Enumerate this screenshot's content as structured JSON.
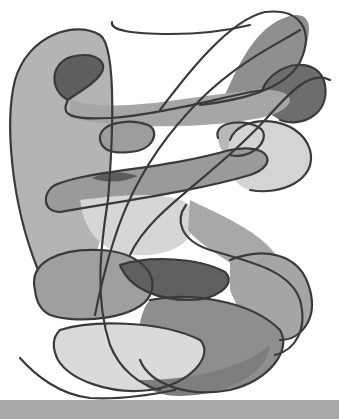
{
  "image": {
    "kind": "abstract-pencil-drawing",
    "palette": {
      "background": "#ffffff",
      "outline": "#3a3a3a",
      "light": "#d9d9d9",
      "mid_light": "#bdbdbd",
      "mid": "#a3a3a3",
      "mid_dark": "#8a8a8a",
      "dark": "#6a6a6a",
      "darkest": "#555555",
      "bottom_band": "#a9a9a9"
    },
    "regions": [
      {
        "name": "left-tall-lobe",
        "fill": "#b4b4b4",
        "d": "M38,270 C10,200 5,120 15,80 C28,35 75,20 100,35 C118,48 112,150 108,200 C100,260 80,300 60,300 Z"
      },
      {
        "name": "top-left-dark-lobe",
        "fill": "#5f5f5f",
        "d": "M68,100 C48,90 50,60 75,56 C95,52 110,62 100,75 C92,86 78,92 68,100 Z"
      },
      {
        "name": "top-right-lobe",
        "fill": "#8f8f8f",
        "d": "M225,95 C240,60 260,20 295,15 C320,14 305,50 300,62 C285,80 265,92 225,95 Z"
      },
      {
        "name": "right-dark-lobe",
        "fill": "#6d6d6d",
        "d": "M262,90 C275,60 320,55 325,85 C330,115 300,128 280,120 C265,113 260,100 262,90 Z"
      },
      {
        "name": "upper-band",
        "fill": "#a6a6a6",
        "d": "M70,100 C120,115 190,95 260,90 C300,88 300,110 260,118 C210,128 130,130 70,118 Z"
      },
      {
        "name": "small-oval-left",
        "fill": "#9d9d9d",
        "d": "M100,140 C98,122 130,118 148,125 C160,130 155,150 130,152 C112,154 102,150 100,140 Z"
      },
      {
        "name": "small-oval-right",
        "fill": "#b8b8b8",
        "d": "M218,138 C212,120 250,118 262,130 C270,142 250,160 230,155 C220,152 219,145 218,138 Z"
      },
      {
        "name": "right-light-oval",
        "fill": "#d4d4d4",
        "d": "M230,140 C240,112 300,115 310,150 C318,180 280,196 250,190 C228,184 224,160 230,140 Z"
      },
      {
        "name": "center-band",
        "fill": "#9a9a9a",
        "d": "M55,185 C90,170 160,170 230,150 C270,142 280,165 250,175 C200,190 130,200 60,212 C42,212 42,192 55,185 Z"
      },
      {
        "name": "center-dark-wedge",
        "fill": "#5c5c5c",
        "d": "M92,178 C108,170 125,172 138,176 C125,182 108,184 92,178 Z"
      },
      {
        "name": "middle-light-field",
        "fill": "#d6d6d6",
        "d": "M80,200 C120,195 170,190 190,205 C200,230 190,250 150,255 C110,258 85,240 80,200 Z"
      },
      {
        "name": "middle-s-curve",
        "fill": "#a8a8a8",
        "d": "M190,200 C220,215 260,230 280,260 C290,280 260,285 240,270 C220,255 200,245 188,230 Z"
      },
      {
        "name": "lower-left-oval",
        "fill": "#9f9f9f",
        "d": "M35,290 C28,262 60,248 100,250 C140,252 160,275 150,295 C140,318 80,325 50,315 C40,310 36,300 35,290 Z"
      },
      {
        "name": "lower-center-dark",
        "fill": "#606060",
        "d": "M120,265 C150,255 200,258 225,272 C238,285 215,300 190,300 C160,300 130,290 120,265 Z"
      },
      {
        "name": "lower-right-lobe",
        "fill": "#a5a5a5",
        "d": "M230,260 C260,248 300,250 310,290 C318,320 300,340 280,340 C255,340 240,315 230,290 Z"
      },
      {
        "name": "lower-gray-shape",
        "fill": "#8e8e8e",
        "d": "M150,300 C190,292 250,300 280,330 C292,350 270,380 230,390 C190,398 150,385 140,360 C135,340 140,310 150,300 Z"
      },
      {
        "name": "bottom-light-oval",
        "fill": "#dadada",
        "d": "M60,330 C90,320 160,320 200,340 C215,355 190,385 150,390 C110,395 70,380 58,360 C52,348 52,338 60,330 Z"
      },
      {
        "name": "bottom-dark-crescent",
        "fill": "#7d7d7d",
        "d": "M140,380 C190,380 240,370 270,345 C268,372 230,395 180,396 C160,396 148,390 140,380 Z"
      }
    ],
    "outlines": [
      {
        "name": "top-squiggle-line",
        "d": "M112,22 C110,30 130,34 170,34 C200,34 230,30 250,25"
      },
      {
        "name": "left-lobe-outline",
        "d": "M108,200 C112,150 118,48 100,35 C75,20 28,35 15,80 C5,120 10,200 38,270"
      },
      {
        "name": "dark-lobe-outline",
        "d": "M68,100 C48,90 50,60 75,56 C95,52 110,62 100,75 C92,86 78,92 68,100 C60,115 70,120 110,118 C160,115 230,95 262,90"
      },
      {
        "name": "top-right-outline",
        "d": "M160,110 C190,70 230,20 265,12 C300,8 315,30 300,62 C285,90 240,100 200,105"
      },
      {
        "name": "right-lobe-outline",
        "d": "M262,90 C275,60 320,55 325,85 C330,115 300,128 280,120"
      },
      {
        "name": "long-diagonal-1",
        "d": "M95,315 C110,240 130,170 200,100 C240,60 285,40 300,30"
      },
      {
        "name": "long-diagonal-2",
        "d": "M130,255 C150,210 210,180 265,120 C290,92 310,70 330,80"
      },
      {
        "name": "center-band-outline",
        "d": "M55,185 C90,170 160,170 230,150 C270,142 280,165 250,175 C200,190 130,200 60,212 C42,212 42,192 55,185 Z"
      },
      {
        "name": "small-oval-left-outline",
        "d": "M100,140 C98,122 130,118 148,125 C160,130 155,150 130,152 C112,154 102,150 100,140 Z"
      },
      {
        "name": "small-oval-right-outline",
        "d": "M218,138 C212,120 250,118 262,130 C270,142 250,160 230,155"
      },
      {
        "name": "right-light-oval-outline",
        "d": "M230,140 C240,112 300,115 310,150 C318,180 280,196 250,190"
      },
      {
        "name": "s-curve-outline",
        "d": "M186,205 C175,220 180,240 210,250 C250,262 290,270 300,300 C308,330 295,350 275,355"
      },
      {
        "name": "lower-left-oval-outline",
        "d": "M35,290 C28,262 60,248 100,250 C140,252 160,275 150,295 C140,318 80,325 50,315 C40,310 36,300 35,290 Z"
      },
      {
        "name": "lower-center-outline",
        "d": "M120,265 C150,255 200,258 225,272 C238,285 215,300 190,300 C160,300 130,290 120,265"
      },
      {
        "name": "lower-right-outline",
        "d": "M230,260 C260,248 300,250 310,290 C318,320 300,340 280,340"
      },
      {
        "name": "lower-gray-outline",
        "d": "M150,300 C190,292 250,300 280,330 C292,350 270,380 230,390 C190,398 150,385 140,360"
      },
      {
        "name": "bottom-oval-outline",
        "d": "M60,330 C90,320 160,320 200,340 C215,355 190,385 150,390 C110,395 70,380 58,360 C52,348 52,338 60,330 Z"
      },
      {
        "name": "bottom-left-tail",
        "d": "M20,358 C35,375 60,395 90,398 C120,400 150,395 175,390"
      },
      {
        "name": "left-vertical",
        "d": "M108,200 C100,250 95,300 110,345 C120,370 140,385 160,390"
      }
    ]
  }
}
